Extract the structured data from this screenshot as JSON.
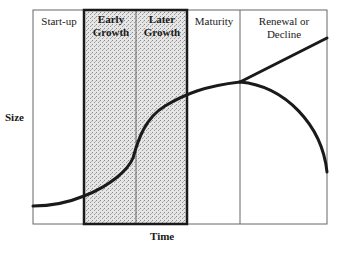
{
  "diagram": {
    "type": "business-life-cycle",
    "axes": {
      "y_label": "Size",
      "x_label": "Time"
    },
    "stages": [
      {
        "label": "Start-up",
        "emphasis": false
      },
      {
        "label": "Early Growth",
        "line1": "Early",
        "line2": "Growth",
        "emphasis": true
      },
      {
        "label": "Later Growth",
        "line1": "Later",
        "line2": "Growth",
        "emphasis": true
      },
      {
        "label": "Maturity",
        "emphasis": false
      },
      {
        "label": "Renewal or Decline",
        "line1": "Renewal or",
        "line2": "Decline",
        "emphasis": false
      }
    ],
    "highlighted_region": "Early Growth + Later Growth (stippled)",
    "curve": {
      "description": "S-shaped growth curve peaking at maturity, then branching into renewal (rising line) or decline (falling curve)",
      "branches": [
        "Renewal",
        "Decline"
      ]
    },
    "colors": {
      "line": "#1a1a1a",
      "frame": "#555555",
      "shade": "#d9d9d9"
    }
  }
}
